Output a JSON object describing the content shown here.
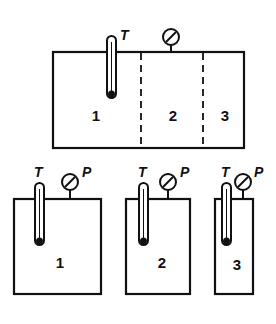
{
  "diagram": {
    "top_vessel": {
      "thermometer_label": "T",
      "sections": [
        "1",
        "2",
        "3"
      ]
    },
    "separate_vessels": [
      {
        "number": "1",
        "thermometer_label": "T",
        "gauge_label": "P"
      },
      {
        "number": "2",
        "thermometer_label": "T",
        "gauge_label": "P"
      },
      {
        "number": "3",
        "thermometer_label": "T",
        "gauge_label": "P"
      }
    ],
    "colors": {
      "line": "#111111",
      "background": "#ffffff"
    }
  }
}
